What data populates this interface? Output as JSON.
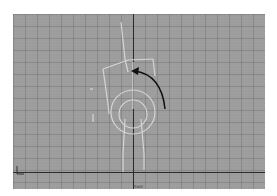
{
  "viewport": {
    "view_label": "Front",
    "background_color": "#9c9c9c",
    "grid_color": "#7a7a7a",
    "axis_color": "#2a2a2a",
    "rig_color": "#d8d8d8",
    "arrow_color": "#111111"
  },
  "icons": {
    "axis_gizmo": "axis-tripod-icon",
    "rotate_arrow": "rotate-arrow-icon"
  }
}
